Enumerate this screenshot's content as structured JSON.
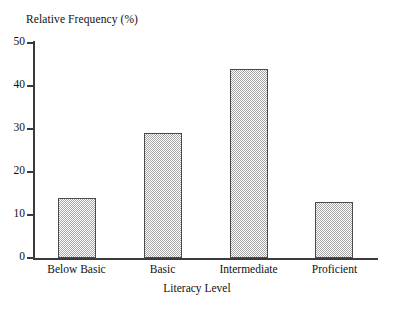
{
  "chart_data": {
    "type": "bar",
    "title": "",
    "categories": [
      "Below Basic",
      "Basic",
      "Intermediate",
      "Proficient"
    ],
    "values": [
      14,
      29,
      44,
      13
    ],
    "xlabel": "Literacy Level",
    "ylabel": "Relative Frequency (%)",
    "ylim": [
      0,
      50
    ],
    "yticks": [
      0,
      10,
      20,
      30,
      40,
      50
    ],
    "ytick_labels": [
      "0",
      "10",
      "20",
      "30",
      "40",
      "50"
    ],
    "grid": false,
    "legend": null,
    "bar_fill": "#a8a8a8",
    "bar_border": "#4a4a4a",
    "axis_color": "#3b3b3b",
    "background": "#ffffff"
  },
  "axes": {
    "y_title": "Relative Frequency (%)",
    "x_title": "Literacy Level",
    "y_ticks": [
      {
        "label": "50",
        "value": 50
      },
      {
        "label": "40",
        "value": 40
      },
      {
        "label": "30",
        "value": 30
      },
      {
        "label": "20",
        "value": 20
      },
      {
        "label": "10",
        "value": 10
      },
      {
        "label": "0",
        "value": 0
      }
    ]
  },
  "bars": [
    {
      "label": "Below Basic",
      "value": 14
    },
    {
      "label": "Basic",
      "value": 29
    },
    {
      "label": "Intermediate",
      "value": 44
    },
    {
      "label": "Proficient",
      "value": 13
    }
  ]
}
